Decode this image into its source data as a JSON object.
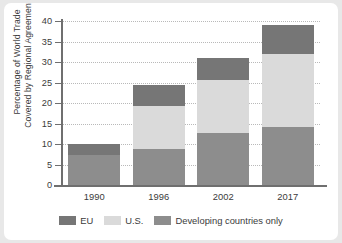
{
  "chart_data": {
    "type": "bar",
    "stacked": true,
    "title": "",
    "xlabel": "",
    "ylabel": "Percentage of World Trade Covered by Regional Agreements",
    "ylabel_lines": [
      "Percentage of World Trade",
      "Covered by Regional Agreements"
    ],
    "categories": [
      "1990",
      "1996",
      "2002",
      "2017"
    ],
    "series": [
      {
        "name": "Developing countries only",
        "color": "#8d8d8d",
        "values": [
          7.2,
          8.8,
          12.6,
          14.1
        ]
      },
      {
        "name": "U.S.",
        "color": "#dadada",
        "values": [
          0.0,
          10.5,
          13.1,
          17.9
        ]
      },
      {
        "name": "EU",
        "color": "#767676",
        "values": [
          2.9,
          5.2,
          5.4,
          7.0
        ]
      }
    ],
    "stack_order": [
      "Developing countries only",
      "U.S.",
      "EU"
    ],
    "totals": [
      10.1,
      24.5,
      31.1,
      39.0
    ],
    "yticks": [
      0,
      5,
      10,
      15,
      20,
      25,
      30,
      35,
      40
    ],
    "ytick_labels": [
      "0",
      "5",
      "10",
      "15",
      "20",
      "25",
      "30",
      "35",
      "40"
    ],
    "ylim": [
      0,
      40
    ],
    "grid": true,
    "grid_style": "dotted",
    "legend_position": "bottom",
    "legend": [
      {
        "label": "EU",
        "color": "#767676"
      },
      {
        "label": "U.S.",
        "color": "#dadada"
      },
      {
        "label": "Developing countries only",
        "color": "#8d8d8d"
      }
    ]
  }
}
